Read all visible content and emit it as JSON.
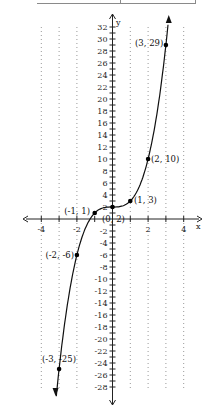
{
  "chart_data": {
    "type": "line",
    "title": "",
    "xlabel": "x",
    "ylabel": "y",
    "xlim": [
      -5,
      5
    ],
    "ylim": [
      -29,
      33
    ],
    "x_ticks_labeled": [
      -4,
      -2,
      2,
      4
    ],
    "y_ticks_labeled": [
      32,
      30,
      28,
      26,
      24,
      22,
      20,
      18,
      16,
      14,
      12,
      10,
      8,
      6,
      4,
      2,
      -2,
      -4,
      -6,
      -8,
      -10,
      -12,
      -14,
      -16,
      -18,
      -20,
      -22,
      -24,
      -26,
      -28
    ],
    "y_tick_step": 1,
    "grid": "vertical dotted lines at each integer x",
    "series": [
      {
        "name": "curve",
        "x": [
          -3,
          -2,
          -1,
          0,
          1,
          2,
          3
        ],
        "y": [
          -25,
          -6,
          1,
          2,
          3,
          10,
          29
        ],
        "arrows_at_ends": true
      }
    ],
    "points": [
      {
        "label": "(3, 29)",
        "x": 3,
        "y": 29
      },
      {
        "label": "(2, 10)",
        "x": 2,
        "y": 10
      },
      {
        "label": "(1, 3)",
        "x": 1,
        "y": 3
      },
      {
        "label": "(0, 2)",
        "x": 0,
        "y": 2
      },
      {
        "label": "(-1, 1)",
        "x": -1,
        "y": 1
      },
      {
        "label": "(-2, -6)",
        "x": -2,
        "y": -6
      },
      {
        "label": "(-3, -25)",
        "x": -3,
        "y": -25
      }
    ]
  },
  "axis": {
    "x_label": "x",
    "y_label": "y"
  },
  "x_tick_labels": [
    "-4",
    "-2",
    "2",
    "4"
  ],
  "y_tick_labels": [
    "32",
    "30",
    "28",
    "26",
    "24",
    "22",
    "20",
    "18",
    "16",
    "14",
    "12",
    "10",
    "8",
    "6",
    "4",
    "2",
    "-2",
    "-4",
    "-6",
    "-8",
    "-10",
    "-12",
    "-14",
    "-16",
    "-18",
    "-20",
    "-22",
    "-24",
    "-26",
    "-28"
  ],
  "point_labels": [
    "(3, 29)",
    "(2, 10)",
    "(1, 3)",
    "(0, 2)",
    "(-1, 1)",
    "(-2, -6)",
    "(-3, -25)"
  ],
  "colors": {
    "axis": "#222222",
    "curve": "#111111",
    "grid": "#999999"
  }
}
